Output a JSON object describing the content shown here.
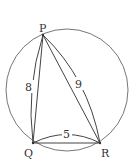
{
  "diagram": {
    "type": "geometry",
    "vertices": {
      "P": {
        "label": "P",
        "x": 43,
        "y": 35
      },
      "Q": {
        "label": "Q",
        "x": 33,
        "y": 143
      },
      "R": {
        "label": "R",
        "x": 100,
        "y": 143
      }
    },
    "circle": {
      "cx": 67,
      "cy": 90,
      "r": 61
    },
    "sides": [
      {
        "name": "PQ",
        "length_label": "8"
      },
      {
        "name": "PR",
        "length_label": "9"
      },
      {
        "name": "QR",
        "length_label": "5"
      }
    ],
    "colors": {
      "lines": "#444444",
      "circle": "#666666",
      "text": "#333333"
    }
  }
}
